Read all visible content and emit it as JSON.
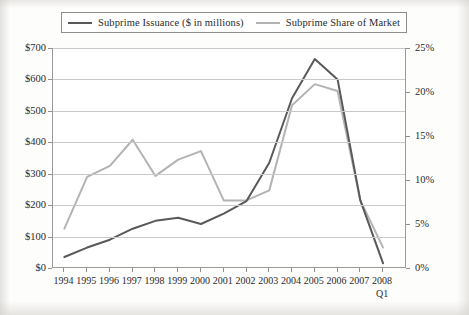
{
  "chart_data": {
    "type": "line",
    "title": "",
    "xlabel": "",
    "x": [
      "1994",
      "1995",
      "1996",
      "1997",
      "1998",
      "1999",
      "2000",
      "2001",
      "2002",
      "2003",
      "2004",
      "2005",
      "2006",
      "2007",
      "2008"
    ],
    "x_sublabels": {
      "2008": "Q1"
    },
    "grid": true,
    "legend_position": "top",
    "series": [
      {
        "name": "Subprime Issuance ($ in millions)",
        "axis": "left",
        "color": "#595959",
        "ylabel": "",
        "ylim": [
          0,
          700
        ],
        "ytick_labels": [
          "$0",
          "$100",
          "$200",
          "$300",
          "$400",
          "$500",
          "$600",
          "$700"
        ],
        "ytick_values": [
          0,
          100,
          200,
          300,
          400,
          500,
          600,
          700
        ],
        "values": [
          35,
          65,
          90,
          125,
          150,
          160,
          140,
          173,
          213,
          335,
          540,
          665,
          600,
          215,
          15
        ]
      },
      {
        "name": "Subprime Share of Market",
        "axis": "right",
        "color": "#b3b3b3",
        "ylabel": "",
        "ylim": [
          0,
          25
        ],
        "ytick_labels": [
          "0%",
          "5%",
          "10%",
          "15%",
          "20%",
          "25%"
        ],
        "ytick_values": [
          0,
          5,
          10,
          15,
          20,
          25
        ],
        "values_percent": [
          4.5,
          10.3,
          11.6,
          14.5,
          10.4,
          12.3,
          13.2,
          7.7,
          7.7,
          8.8,
          18.5,
          20.8,
          20.1,
          7.7,
          2.3
        ],
        "values_in_left_units": [
          125,
          290,
          325,
          408,
          293,
          345,
          372,
          215,
          215,
          247,
          518,
          585,
          563,
          215,
          65
        ]
      }
    ]
  },
  "legend": {
    "entries": [
      {
        "label": "Subprime Issuance ($ in millions)",
        "color": "#595959"
      },
      {
        "label": "Subprime Share of Market",
        "color": "#b3b3b3"
      }
    ]
  },
  "axes": {
    "left_ticks": [
      "$700",
      "$600",
      "$500",
      "$400",
      "$300",
      "$200",
      "$100",
      "$0"
    ],
    "right_ticks": [
      "25%",
      "20%",
      "15%",
      "10%",
      "5%",
      "0%"
    ],
    "x_ticks": [
      "1994",
      "1995",
      "1996",
      "1997",
      "1998",
      "1999",
      "2000",
      "2001",
      "2002",
      "2003",
      "2004",
      "2005",
      "2006",
      "2007",
      "2008"
    ],
    "x_sublabel": "Q1"
  }
}
